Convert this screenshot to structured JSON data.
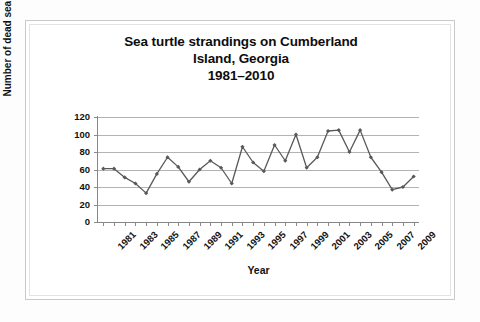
{
  "chart_data": {
    "type": "line",
    "title_lines": [
      "Sea turtle strandings on Cumberland",
      "Island, Georgia",
      "1981–2010"
    ],
    "title": "Sea turtle strandings on Cumberland Island, Georgia 1981–2010",
    "xlabel": "Year",
    "ylabel": "Number of dead sea turtles",
    "ylim": [
      0,
      120
    ],
    "ytick_labels": [
      "0",
      "20",
      "40",
      "60",
      "80",
      "100",
      "120"
    ],
    "ytick_values": [
      0,
      20,
      40,
      60,
      80,
      100,
      120
    ],
    "grid": "horizontal",
    "legend": "none",
    "line_color": "#595959",
    "marker": "diamond",
    "marker_color": "#595959",
    "x": [
      1981,
      1982,
      1983,
      1984,
      1985,
      1986,
      1987,
      1988,
      1989,
      1990,
      1991,
      1992,
      1993,
      1994,
      1995,
      1996,
      1997,
      1998,
      1999,
      2000,
      2001,
      2002,
      2003,
      2004,
      2005,
      2006,
      2007,
      2008,
      2009,
      2010
    ],
    "xtick_labels": [
      "1981",
      "1983",
      "1985",
      "1987",
      "1989",
      "1991",
      "1993",
      "1995",
      "1997",
      "1999",
      "2001",
      "2003",
      "2005",
      "2007",
      "2009"
    ],
    "values": [
      61,
      61,
      51,
      44,
      33,
      55,
      74,
      63,
      46,
      60,
      70,
      62,
      44,
      86,
      68,
      58,
      88,
      70,
      100,
      62,
      74,
      104,
      105,
      80,
      105,
      74,
      57,
      37,
      40,
      52
    ],
    "series": [
      {
        "name": "Dead sea turtles",
        "values": [
          61,
          61,
          51,
          44,
          33,
          55,
          74,
          63,
          46,
          60,
          70,
          62,
          44,
          86,
          68,
          58,
          88,
          70,
          100,
          62,
          74,
          104,
          105,
          80,
          105,
          74,
          57,
          37,
          40,
          52
        ]
      }
    ]
  }
}
